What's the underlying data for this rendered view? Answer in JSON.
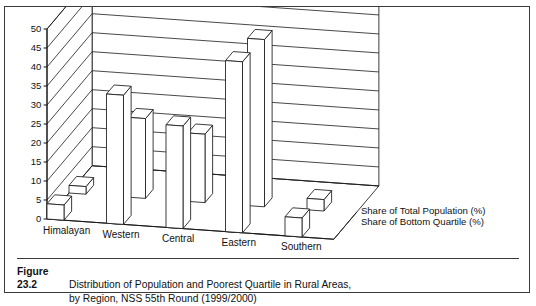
{
  "figure": {
    "number_label": "Figure 23.2",
    "caption_line1": "Distribution of Population and Poorest Quartile in Rural Areas,",
    "caption_line2": "by Region, NSS 55th Round (1999/2000)"
  },
  "legend": {
    "series1": "Share of Total Population (%)",
    "series2": "Share of Bottom Quartile (%)"
  },
  "axis": {
    "ticks": [
      "0",
      "5",
      "10",
      "15",
      "20",
      "25",
      "30",
      "35",
      "40",
      "45",
      "50"
    ]
  },
  "categories": {
    "c0": "Himalayan",
    "c1": "Western",
    "c2": "Central",
    "c3": "Eastern",
    "c4": "Southern"
  },
  "chart_data": {
    "type": "bar",
    "title": "Distribution of Population and Poorest Quartile in Rural Areas, by Region, NSS 55th Round (1999/2000)",
    "xlabel": "",
    "ylabel": "",
    "ylim": [
      0,
      50
    ],
    "ytick_step": 5,
    "grid": true,
    "projection": "3d",
    "legend_position": "right",
    "categories": [
      "Himalayan",
      "Western",
      "Central",
      "Eastern",
      "Southern"
    ],
    "series": [
      {
        "name": "Share of Total Population (%)",
        "values": [
          4,
          34,
          27,
          45,
          5
        ]
      },
      {
        "name": "Share of Bottom Quartile (%)",
        "values": [
          2,
          21,
          18,
          44,
          3
        ]
      }
    ]
  },
  "style": {
    "ink": "#1a1a1a",
    "bar_face": "#ffffff",
    "paper": "#ffffff"
  }
}
